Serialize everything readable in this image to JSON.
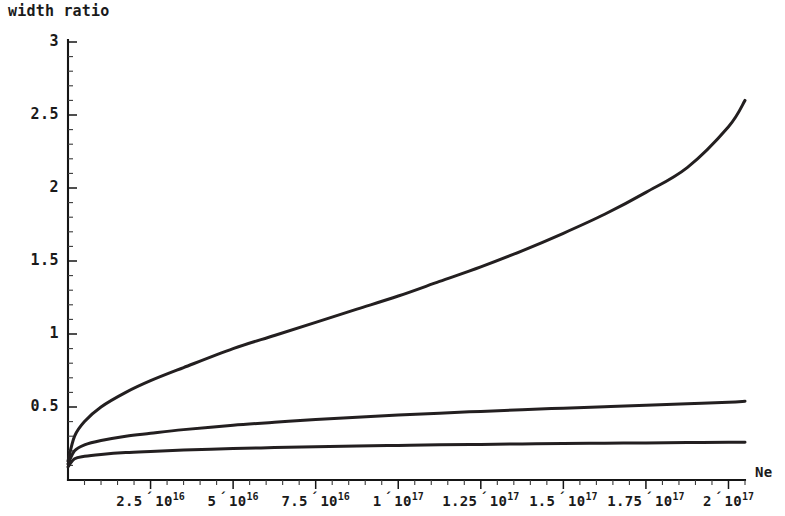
{
  "chart_data": {
    "type": "line",
    "title": "width ratio",
    "xlabel": "Ne",
    "ylabel": "",
    "xlim": [
      0,
      210000000000000000
    ],
    "ylim": [
      0,
      3
    ],
    "grid": false,
    "legend": null,
    "background_color": "#ffffff",
    "curve_color": "#231f20",
    "axis_color": "#151515",
    "x_tick_labels": [
      {
        "mantissa": "2.5",
        "mult": "´",
        "base": "10",
        "exponent": "16",
        "value": 25000000000000000
      },
      {
        "mantissa": "5",
        "mult": "´",
        "base": "10",
        "exponent": "16",
        "value": 50000000000000000
      },
      {
        "mantissa": "7.5",
        "mult": "´",
        "base": "10",
        "exponent": "16",
        "value": 75000000000000000
      },
      {
        "mantissa": "1",
        "mult": "´",
        "base": "10",
        "exponent": "17",
        "value": 100000000000000000
      },
      {
        "mantissa": "1.25",
        "mult": "´",
        "base": "10",
        "exponent": "17",
        "value": 125000000000000000
      },
      {
        "mantissa": "1.5",
        "mult": "´",
        "base": "10",
        "exponent": "17",
        "value": 150000000000000000
      },
      {
        "mantissa": "1.75",
        "mult": "´",
        "base": "10",
        "exponent": "17",
        "value": 175000000000000000
      },
      {
        "mantissa": "2",
        "mult": "´",
        "base": "10",
        "exponent": "17",
        "value": 200000000000000000
      }
    ],
    "y_tick_labels": [
      "0.5",
      "1",
      "1.5",
      "2",
      "2.5",
      "3"
    ],
    "y_tick_values": [
      0.5,
      1,
      1.5,
      2,
      2.5,
      3
    ],
    "x_minor_ticks_per_major": 5,
    "y_minor_ticks_per_major": 5,
    "series": [
      {
        "name": "upper",
        "x": [
          0,
          2,
          5,
          10,
          17.5,
          25,
          35,
          50,
          62.5,
          75,
          87.5,
          100,
          112.5,
          125,
          137.5,
          150,
          162.5,
          175,
          187.5,
          200,
          205
        ],
        "x_units": "1e15",
        "values": [
          0.13,
          0.3,
          0.4,
          0.5,
          0.6,
          0.68,
          0.77,
          0.9,
          0.99,
          1.08,
          1.17,
          1.26,
          1.36,
          1.46,
          1.57,
          1.69,
          1.82,
          1.97,
          2.14,
          2.42,
          2.6
        ]
      },
      {
        "name": "middle",
        "x": [
          0,
          2,
          5,
          10,
          17.5,
          25,
          35,
          50,
          62.5,
          75,
          87.5,
          100,
          112.5,
          125,
          137.5,
          150,
          162.5,
          175,
          187.5,
          200,
          205
        ],
        "x_units": "1e15",
        "values": [
          0.11,
          0.2,
          0.24,
          0.27,
          0.3,
          0.32,
          0.345,
          0.375,
          0.395,
          0.415,
          0.43,
          0.445,
          0.458,
          0.47,
          0.482,
          0.492,
          0.502,
          0.512,
          0.522,
          0.532,
          0.54
        ]
      },
      {
        "name": "lower",
        "x": [
          0,
          2,
          5,
          10,
          17.5,
          25,
          35,
          50,
          62.5,
          75,
          87.5,
          100,
          112.5,
          125,
          137.5,
          150,
          162.5,
          175,
          187.5,
          200,
          205
        ],
        "x_units": "1e15",
        "values": [
          0.09,
          0.145,
          0.162,
          0.175,
          0.188,
          0.196,
          0.205,
          0.215,
          0.222,
          0.228,
          0.233,
          0.237,
          0.241,
          0.244,
          0.247,
          0.25,
          0.252,
          0.254,
          0.256,
          0.258,
          0.259
        ]
      }
    ]
  }
}
